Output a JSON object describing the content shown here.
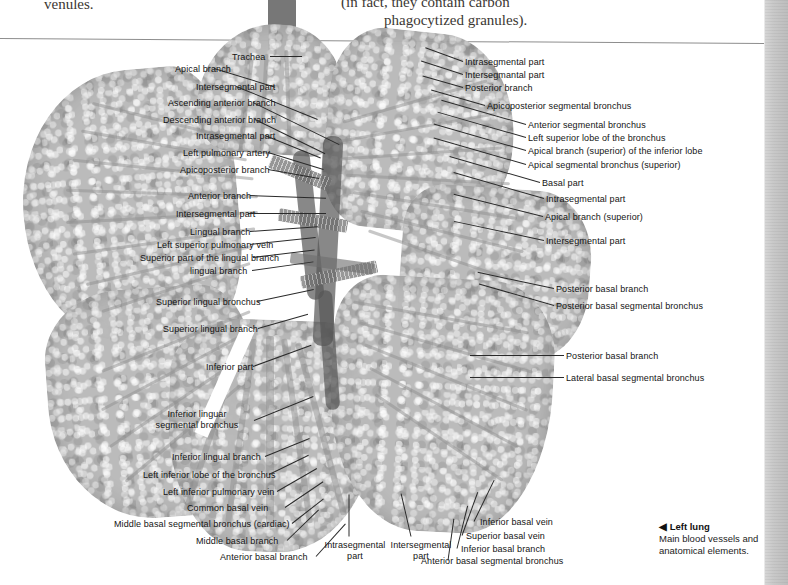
{
  "body_text": {
    "venules": "venules.",
    "paren_line1": "(in fact, they contain carbon",
    "paren_line2": "phagocytized granules)."
  },
  "figure": {
    "title": "Left lung",
    "caption_marker": "◀",
    "caption_line1": "Main blood vessels and",
    "caption_line2": "anatomical elements."
  },
  "labels_top": [
    {
      "text": "Trachea",
      "x": 232,
      "y": 52,
      "align": "right",
      "lx": 270,
      "ly": 56,
      "len": 32,
      "ang": 0
    }
  ],
  "labels_left": [
    {
      "text": "Apical branch",
      "x": 175,
      "y": 64,
      "lx": 214,
      "ly": 68,
      "len": 64,
      "ang": 17
    },
    {
      "text": "Intersegmental part",
      "x": 196,
      "y": 82,
      "lx": 236,
      "ly": 86,
      "len": 88,
      "ang": 22
    },
    {
      "text": "Ascending anterior branch",
      "x": 168,
      "y": 98,
      "lx": 253,
      "ly": 102,
      "len": 96,
      "ang": 26
    },
    {
      "text": "Descending anterior branch",
      "x": 163,
      "y": 115,
      "lx": 255,
      "ly": 119,
      "len": 78,
      "ang": 26
    },
    {
      "text": "Intrasegmental part",
      "x": 196,
      "y": 131,
      "lx": 265,
      "ly": 135,
      "len": 60,
      "ang": 22
    },
    {
      "text": "Left pulmonary artery",
      "x": 183,
      "y": 148,
      "lx": 268,
      "ly": 152,
      "len": 58,
      "ang": 17
    },
    {
      "text": "Apicoposterior branch",
      "x": 180,
      "y": 165,
      "lx": 268,
      "ly": 169,
      "len": 52,
      "ang": 10
    },
    {
      "text": "Anterior branch",
      "x": 188,
      "y": 191,
      "lx": 250,
      "ly": 195,
      "len": 76,
      "ang": 2
    },
    {
      "text": "Intersegmental part",
      "x": 176,
      "y": 209,
      "lx": 248,
      "ly": 213,
      "len": 78,
      "ang": 0
    },
    {
      "text": "Lingual branch",
      "x": 190,
      "y": 227,
      "lx": 250,
      "ly": 231,
      "len": 68,
      "ang": -4
    },
    {
      "text": "Left superior pulmonary vein",
      "x": 157,
      "y": 240,
      "lx": 250,
      "ly": 244,
      "len": 66,
      "ang": -6
    },
    {
      "text": "Superior part of the lingual branch",
      "x": 140,
      "y": 253,
      "lx": 253,
      "ly": 257,
      "len": 62,
      "ang": -7
    },
    {
      "text": "lingual branch",
      "x": 190,
      "y": 266,
      "lx": 252,
      "ly": 270,
      "len": 62,
      "ang": -8
    },
    {
      "text": "Superior lingual bronchus",
      "x": 156,
      "y": 297,
      "lx": 257,
      "ly": 301,
      "len": 58,
      "ang": -12
    },
    {
      "text": "Superior lingual branch",
      "x": 163,
      "y": 324,
      "lx": 258,
      "ly": 328,
      "len": 52,
      "ang": -16
    },
    {
      "text": "Inferior part",
      "x": 206,
      "y": 362,
      "lx": 253,
      "ly": 366,
      "len": 62,
      "ang": -20
    }
  ],
  "labels_left_multiline": [
    {
      "line1": "Inferior linguar",
      "line2": "segmental bronchus",
      "x": 155,
      "y": 409,
      "lx": 254,
      "ly": 420,
      "len": 64,
      "ang": -22
    }
  ],
  "labels_left_lower": [
    {
      "text": "Inferior lingual branch",
      "x": 172,
      "y": 452,
      "lx": 265,
      "ly": 456,
      "len": 48,
      "ang": -22
    },
    {
      "text": "Left inferior lobe of the bronchus",
      "x": 143,
      "y": 470,
      "lx": 269,
      "ly": 474,
      "len": 44,
      "ang": -26
    },
    {
      "text": "Left inferior pulmonary vein",
      "x": 163,
      "y": 487,
      "lx": 277,
      "ly": 491,
      "len": 46,
      "ang": -30
    },
    {
      "text": "Common basal vein",
      "x": 187,
      "y": 503,
      "lx": 285,
      "ly": 507,
      "len": 46,
      "ang": -34
    },
    {
      "text": "Middle basal segmental bronchus (cardiac)",
      "x": 114,
      "y": 519,
      "lx": 292,
      "ly": 523,
      "len": 40,
      "ang": -38
    },
    {
      "text": "Middle basal branch",
      "x": 196,
      "y": 536,
      "lx": 287,
      "ly": 540,
      "len": 44,
      "ang": -44
    },
    {
      "text": "Anterior basal branch",
      "x": 220,
      "y": 552,
      "lx": 316,
      "ly": 556,
      "len": 44,
      "ang": -48
    }
  ],
  "labels_bottom_center": [
    {
      "line1": "Intrasegmental",
      "line2": "part",
      "x": 313,
      "y": 540,
      "lx": 349,
      "ly": 536,
      "len": 42,
      "ang": -90
    },
    {
      "line1": "Intersegmental",
      "line2": "part",
      "x": 379,
      "y": 540,
      "lx": 411,
      "ly": 536,
      "len": 44,
      "ang": -103
    }
  ],
  "labels_bottom_right": [
    {
      "text": "Inferior basal vein",
      "x": 480,
      "y": 517,
      "lx": 474,
      "ly": 521,
      "len": 46,
      "ang": -64
    },
    {
      "text": "Superior basal vein",
      "x": 466,
      "y": 531,
      "lx": 462,
      "ly": 535,
      "len": 46,
      "ang": -70
    },
    {
      "text": "Inferior basal branch",
      "x": 461,
      "y": 544,
      "lx": 457,
      "ly": 548,
      "len": 44,
      "ang": -76
    },
    {
      "text": "Anterior basal segmental bronchus",
      "x": 421,
      "y": 556,
      "lx": 448,
      "ly": 560,
      "len": 42,
      "ang": -82
    }
  ],
  "labels_right": [
    {
      "text": "Intrasegmental part",
      "x": 465,
      "y": 57,
      "lx": 463,
      "ly": 61,
      "len": 40,
      "ang": 200
    },
    {
      "text": "Intersegmantal part",
      "x": 465,
      "y": 70,
      "lx": 463,
      "ly": 74,
      "len": 44,
      "ang": 198
    },
    {
      "text": "Posterior branch",
      "x": 465,
      "y": 83,
      "lx": 463,
      "ly": 87,
      "len": 42,
      "ang": 196
    },
    {
      "text": "Apicoposterior segmental bronchus",
      "x": 487,
      "y": 101,
      "lx": 485,
      "ly": 105,
      "len": 56,
      "ang": 196
    },
    {
      "text": "Anterior segmental bronchus",
      "x": 528,
      "y": 120,
      "lx": 526,
      "ly": 124,
      "len": 88,
      "ang": 196
    },
    {
      "text": "Left superior lobe of the bronchus",
      "x": 528,
      "y": 133,
      "lx": 526,
      "ly": 137,
      "len": 92,
      "ang": 196
    },
    {
      "text": "Apical branch (superior) of the inferior lobe",
      "x": 528,
      "y": 146,
      "lx": 526,
      "ly": 150,
      "len": 96,
      "ang": 196
    },
    {
      "text": "Apical segmental bronchus (superior)",
      "x": 528,
      "y": 160,
      "lx": 526,
      "ly": 164,
      "len": 96,
      "ang": 196
    },
    {
      "text": "Basal part",
      "x": 542,
      "y": 178,
      "lx": 540,
      "ly": 182,
      "len": 94,
      "ang": 196
    },
    {
      "text": "Intrasegmental part",
      "x": 546,
      "y": 194,
      "lx": 544,
      "ly": 198,
      "len": 94,
      "ang": 196
    },
    {
      "text": "Apical branch (superior)",
      "x": 545,
      "y": 212,
      "lx": 543,
      "ly": 216,
      "len": 92,
      "ang": 194
    },
    {
      "text": "Intersegmental part",
      "x": 546,
      "y": 236,
      "lx": 544,
      "ly": 240,
      "len": 92,
      "ang": 192
    },
    {
      "text": "Posterior basal branch",
      "x": 556,
      "y": 284,
      "lx": 554,
      "ly": 288,
      "len": 78,
      "ang": 192
    },
    {
      "text": "Posterior basal segmental bronchus",
      "x": 556,
      "y": 301,
      "lx": 554,
      "ly": 305,
      "len": 78,
      "ang": 196
    },
    {
      "text": "Posterior basal branch",
      "x": 566,
      "y": 351,
      "lx": 564,
      "ly": 355,
      "len": 94,
      "ang": 180
    },
    {
      "text": "Lateral basal segmental bronchus",
      "x": 566,
      "y": 373,
      "lx": 564,
      "ly": 377,
      "len": 94,
      "ang": 180
    }
  ]
}
